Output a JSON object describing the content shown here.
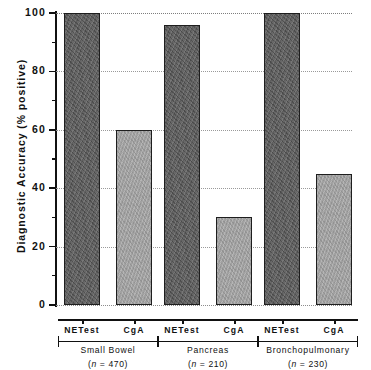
{
  "chart_data": {
    "type": "bar",
    "title": "",
    "xlabel": "",
    "ylabel": "Diagnostic Accuracy (% positive)",
    "ylim": [
      0,
      100
    ],
    "yticks": [
      0,
      20,
      40,
      60,
      80,
      100
    ],
    "ytick_labels": [
      "0",
      "20",
      "40",
      "60",
      "80",
      "100"
    ],
    "yminor_ticks": [
      10,
      30,
      50,
      70,
      90
    ],
    "grid": "horizontal-dotted",
    "legend": "none",
    "categories": [
      "Small Bowel",
      "Pancreas",
      "Bronchopulmonary"
    ],
    "series": [
      {
        "name": "NETest",
        "values": [
          100,
          96,
          100
        ],
        "color": "#5d5d5d"
      },
      {
        "name": "CgA",
        "values": [
          60,
          30,
          45
        ],
        "color": "#a7a7a7"
      }
    ],
    "groups": [
      {
        "label": "Small Bowel",
        "n_label": "(n = 470)",
        "n": 470,
        "bars": [
          {
            "series": "NETest",
            "value": 100
          },
          {
            "series": "CgA",
            "value": 60
          }
        ]
      },
      {
        "label": "Pancreas",
        "n_label": "(n = 210)",
        "n": 210,
        "bars": [
          {
            "series": "NETest",
            "value": 96
          },
          {
            "series": "CgA",
            "value": 30
          }
        ]
      },
      {
        "label": "Bronchopulmonary",
        "n_label": "(n = 230)",
        "n": 230,
        "bars": [
          {
            "series": "NETest",
            "value": 100
          },
          {
            "series": "CgA",
            "value": 45
          }
        ]
      }
    ]
  },
  "axis": {
    "y_title": "Diagnostic Accuracy (% positive)",
    "tick_100": "100",
    "tick_80": "80",
    "tick_60": "60",
    "tick_40": "40",
    "tick_20": "20",
    "tick_0": "0"
  },
  "labels": {
    "g1_s1": "NETest",
    "g1_s2": "CgA",
    "g2_s1": "NETest",
    "g2_s2": "CgA",
    "g3_s1": "NETest",
    "g3_s2": "CgA",
    "g1_name": "Small Bowel",
    "g1_n_prefix": "(",
    "g1_n_body": "n",
    "g1_n_suffix": " = 470)",
    "g2_name": "Pancreas",
    "g2_n_prefix": "(",
    "g2_n_body": "n",
    "g2_n_suffix": " = 210)",
    "g3_name": "Bronchopulmonary",
    "g3_n_prefix": "(",
    "g3_n_body": "n",
    "g3_n_suffix": " = 230)"
  }
}
